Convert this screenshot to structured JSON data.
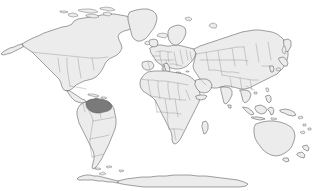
{
  "map": {
    "title": "World Map",
    "projection": "equirectangular",
    "width": 313,
    "height": 191,
    "background_color": "#ffffff",
    "land_fill_color": "#ececec",
    "land_outline_color": "#555555",
    "internal_border_color": "#8c8c8c",
    "highlight_fill_color": "#7a7a7a",
    "highlight_outline_color": "#5a5a5a",
    "has_labels": false,
    "has_legend": false,
    "has_graticule": false,
    "has_frame": false,
    "continents": [
      {
        "name": "north-america",
        "state": "normal"
      },
      {
        "name": "south-america",
        "state": "normal"
      },
      {
        "name": "greenland",
        "state": "normal"
      },
      {
        "name": "europe",
        "state": "normal"
      },
      {
        "name": "africa",
        "state": "normal"
      },
      {
        "name": "asia",
        "state": "normal"
      },
      {
        "name": "australia",
        "state": "normal"
      },
      {
        "name": "antarctica",
        "state": "normal"
      }
    ],
    "highlight": {
      "label": "northern-south-america",
      "description": "Shaded region covering Venezuela, Guyana, Suriname, French Guiana and northern Brazil",
      "fill_color": "#7a7a7a",
      "bounds": {
        "x": 86,
        "y": 99,
        "width": 22,
        "height": 14
      }
    }
  }
}
